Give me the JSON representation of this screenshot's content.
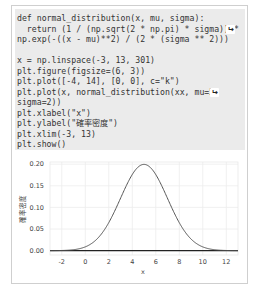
{
  "code": {
    "lines": [
      "def normal_distribution(x, mu, sigma):",
      "  return (1 / (np.sqrt(2 * np.pi) * sigma)) *",
      "np.exp(-((x - mu)**2) / (2 * (sigma ** 2)))",
      "",
      "x = np.linspace(-3, 13, 301)",
      "plt.figure(figsize=(6, 3))",
      "plt.plot([-4, 14], [0, 0], c=\"k\")",
      "plt.plot(x, normal_distribution(xx, mu=5,",
      "sigma=2))",
      "plt.xlabel(\"x\")",
      "plt.ylabel(\"確率密度\")",
      "plt.xlim(-3, 13)",
      "plt.show()"
    ],
    "continuation_icon": "↩"
  },
  "chart_data": {
    "type": "line",
    "title": "",
    "xlabel": "x",
    "ylabel": "確率密度",
    "xlim": [
      -3,
      13
    ],
    "ylim": [
      -0.01,
      0.205
    ],
    "xticks": [
      "-2",
      "0",
      "2",
      "4",
      "6",
      "8",
      "10",
      "12"
    ],
    "yticks": [
      "0.00",
      "0.05",
      "0.10",
      "0.15",
      "0.20"
    ],
    "grid": true,
    "series": [
      {
        "name": "normal_distribution(mu=5, sigma=2)",
        "color": "#555555",
        "mu": 5,
        "sigma": 2,
        "x": [
          -3,
          -2,
          -1,
          0,
          1,
          2,
          3,
          4,
          5,
          6,
          7,
          8,
          9,
          10,
          11,
          12,
          13
        ],
        "values": [
          6.69e-05,
          0.000436,
          0.00222,
          0.00876,
          0.027,
          0.0648,
          0.121,
          0.176,
          0.1995,
          0.176,
          0.121,
          0.0648,
          0.027,
          0.00876,
          0.00222,
          0.000436,
          6.69e-05
        ]
      },
      {
        "name": "baseline",
        "color": "#000000",
        "x": [
          -4,
          14
        ],
        "values": [
          0,
          0
        ]
      }
    ]
  }
}
